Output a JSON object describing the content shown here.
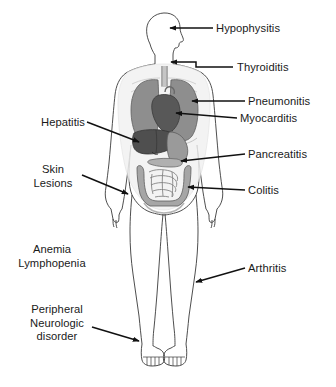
{
  "figure": {
    "body_outline_color": "#3a3a3a",
    "text_color": "#1a1a1a",
    "background_color": "#ffffff",
    "organ_colors": {
      "lung": "#8e8e8e",
      "heart": "#585858",
      "liver": "#4f4f4f",
      "stomach": "#9a9a9a",
      "intestine": "#a6a6a6",
      "trachea": "#9e9e9e",
      "pelvis": "#b4b4b4"
    }
  },
  "labels": [
    {
      "id": "hypophysitis",
      "text": "Hypophysitis",
      "side": "right",
      "align": "left",
      "x": 216,
      "y": 22,
      "has_arrow": true,
      "target": "pituitary-gland-head"
    },
    {
      "id": "thyroiditis",
      "text": "Thyroiditis",
      "side": "right",
      "align": "left",
      "x": 237,
      "y": 61,
      "has_arrow": true,
      "target": "thyroid-neck"
    },
    {
      "id": "pneumonitis",
      "text": "Pneumonitis",
      "side": "right",
      "align": "left",
      "x": 248,
      "y": 95,
      "has_arrow": true,
      "target": "lung"
    },
    {
      "id": "myocarditis",
      "text": "Myocarditis",
      "side": "right",
      "align": "left",
      "x": 240,
      "y": 112,
      "has_arrow": true,
      "target": "heart"
    },
    {
      "id": "pancreatitis",
      "text": "Pancreatitis",
      "side": "right",
      "align": "left",
      "x": 248,
      "y": 148,
      "has_arrow": true,
      "target": "pancreas"
    },
    {
      "id": "colitis",
      "text": "Colitis",
      "side": "right",
      "align": "left",
      "x": 248,
      "y": 184,
      "has_arrow": true,
      "target": "colon"
    },
    {
      "id": "arthritis",
      "text": "Arthritis",
      "side": "right",
      "align": "left",
      "x": 248,
      "y": 262,
      "has_arrow": true,
      "target": "knee-joint"
    },
    {
      "id": "hepatitis",
      "text": "Hepatitis",
      "side": "left",
      "align": "right",
      "x": 30,
      "y": 116,
      "has_arrow": true,
      "target": "liver"
    },
    {
      "id": "skin-lesions",
      "text": "Skin\nLesions",
      "side": "left",
      "align": "center",
      "x": 24,
      "y": 163,
      "has_arrow": true,
      "target": "skin-forearm"
    },
    {
      "id": "anemia-lymphopenia",
      "text": "Anemia\nLymphopenia",
      "side": "left",
      "align": "center",
      "x": 12,
      "y": 243,
      "has_arrow": false,
      "target": "blood"
    },
    {
      "id": "peripheral-neurologic-disorder",
      "text": "Peripheral\nNeurologic\ndisorder",
      "side": "left",
      "align": "center",
      "x": 22,
      "y": 303,
      "has_arrow": true,
      "target": "lower-leg-nerve"
    }
  ]
}
